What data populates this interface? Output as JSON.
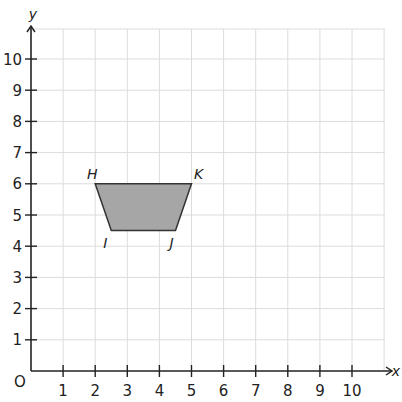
{
  "chart_data": {
    "type": "coordinate-plane",
    "title": "",
    "xlabel": "x",
    "ylabel": "y",
    "origin_label": "O",
    "xlim": [
      0,
      11
    ],
    "ylim": [
      0,
      11
    ],
    "x_ticks": [
      1,
      2,
      3,
      4,
      5,
      6,
      7,
      8,
      9,
      10
    ],
    "y_ticks": [
      1,
      2,
      3,
      4,
      5,
      6,
      7,
      8,
      9,
      10
    ],
    "grid": true,
    "shape": {
      "name": "trapezium HIJK",
      "fill": "#a6a6a6",
      "stroke": "#333333",
      "vertices": [
        {
          "label": "H",
          "x": 2,
          "y": 6
        },
        {
          "label": "I",
          "x": 2.5,
          "y": 4.5
        },
        {
          "label": "J",
          "x": 4.5,
          "y": 4.5
        },
        {
          "label": "K",
          "x": 5,
          "y": 6
        }
      ]
    }
  },
  "colors": {
    "grid": "#dcdcdc",
    "axis": "#222222",
    "shape_fill": "#a6a6a6"
  }
}
